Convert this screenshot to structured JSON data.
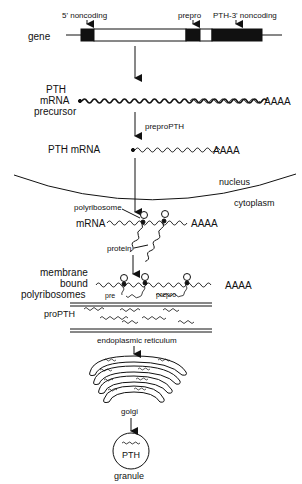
{
  "gene": {
    "label": "gene",
    "annotations": {
      "five_prime": "5' noncoding",
      "prepro": "prepro",
      "pth_three_prime": "PTH-3' noncoding"
    }
  },
  "precursor": {
    "label_line1": "PTH",
    "label_line2": "mRNA",
    "label_line3": "precursor",
    "polyA": "AAAA"
  },
  "processing": {
    "label": "preproPTH"
  },
  "mature_mrna": {
    "label": "PTH  mRNA",
    "polyA": "AAAA"
  },
  "compartments": {
    "nucleus": "nucleus",
    "cytoplasm": "cytoplasm"
  },
  "free_polysome": {
    "polyribosome": "polyribosome",
    "mrna": "mRNA",
    "polyA": "AAAA",
    "protein": "protein"
  },
  "membrane_polysome": {
    "label_line1": "membrane",
    "label_line2": "bound",
    "label_line3": "polyribosomes",
    "polyA": "AAAA",
    "pre": "pre",
    "prepro": "prepro"
  },
  "er": {
    "propth": "proPTH",
    "label": "endoplasmic  reticulum"
  },
  "golgi": {
    "label": "golgi"
  },
  "granule": {
    "content": "PTH",
    "label": "granule"
  },
  "colors": {
    "ink": "#111111",
    "background": "#ffffff"
  }
}
